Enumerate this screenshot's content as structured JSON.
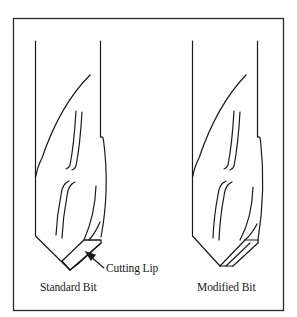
{
  "figure": {
    "labels": {
      "standard_bit": "Standard Bit",
      "modified_bit": "Modified Bit",
      "cutting_lip": "Cutting Lip"
    },
    "colors": {
      "line": "#1a1a1a",
      "background": "#ffffff",
      "frame": "#2a2a2a"
    },
    "items": [
      {
        "name": "standard-bit",
        "label": "Standard Bit"
      },
      {
        "name": "modified-bit",
        "label": "Modified Bit"
      }
    ]
  }
}
